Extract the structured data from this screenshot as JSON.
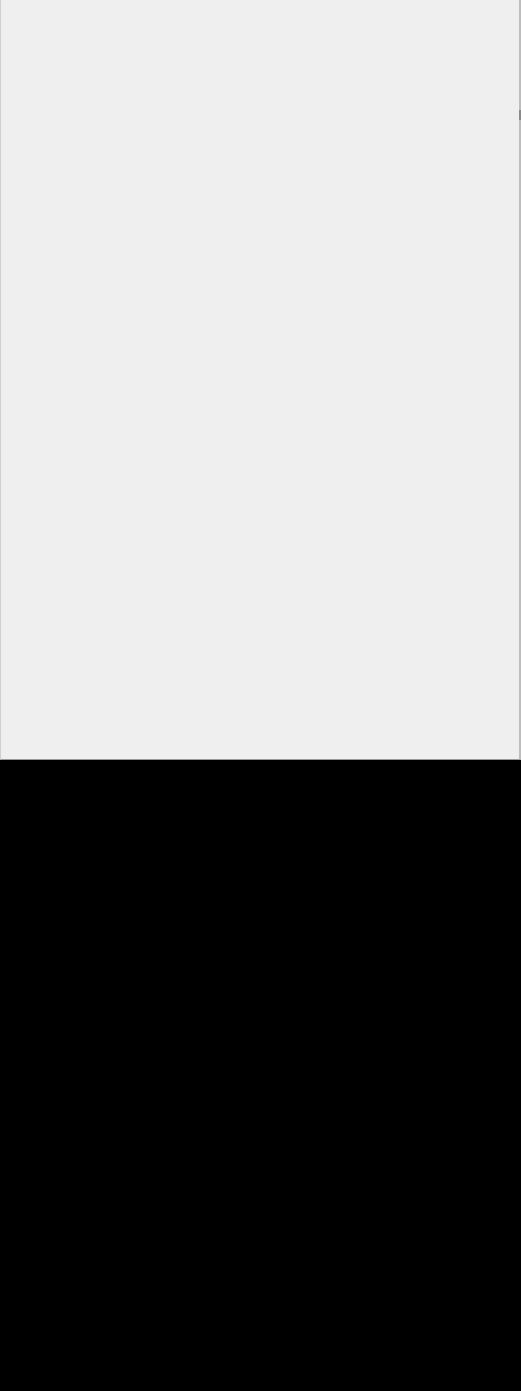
{
  "screen": {
    "width": 521,
    "height": 1391
  },
  "content_panel": {
    "state": "blank",
    "background_color": "#efefef",
    "border_color": "#bdbdbd",
    "height": 760
  },
  "blackout_region": {
    "background_color": "#000000",
    "top": 760,
    "height": 631
  }
}
